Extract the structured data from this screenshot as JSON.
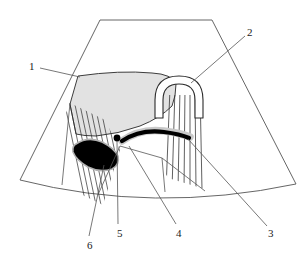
{
  "figure": {
    "type": "ultrasound-sector-scan-line-diagram",
    "title": "",
    "background_color": "#ffffff",
    "outline_color": "#4d4d4d",
    "shade_color": "#e2e2e2",
    "solid_color": "#000000",
    "canvas": {
      "width": 307,
      "height": 276
    }
  },
  "labels": [
    {
      "id": "1",
      "text": "1",
      "x": 29,
      "y": 61,
      "leader_from": [
        40,
        68
      ],
      "leader_to": [
        80,
        77
      ],
      "points_to": "shaded-wedge-region"
    },
    {
      "id": "2",
      "text": "2",
      "x": 247,
      "y": 27,
      "leader_from": [
        245,
        36
      ],
      "leader_to": [
        191,
        83
      ],
      "points_to": "arch-structure"
    },
    {
      "id": "3",
      "text": "3",
      "x": 268,
      "y": 228,
      "leader_from": [
        267,
        226
      ],
      "leader_to": [
        188,
        139
      ],
      "points_to": "solid-band-right-end"
    },
    {
      "id": "4",
      "text": "4",
      "x": 176,
      "y": 228,
      "leader_from": [
        176,
        224
      ],
      "leader_to": [
        129,
        146
      ],
      "points_to": "band-lower-margin"
    },
    {
      "id": "5",
      "text": "5",
      "x": 117,
      "y": 228,
      "leader_from": [
        118,
        224
      ],
      "leader_to": [
        117,
        141
      ],
      "points_to": "focal-dot"
    },
    {
      "id": "6",
      "text": "6",
      "x": 87,
      "y": 240,
      "leader_from": [
        89,
        236
      ],
      "leader_to": [
        104,
        165
      ],
      "points_to": "solid-oval-lesion"
    }
  ],
  "regions": {
    "sector_fan": "trapezoidal curved-linear ultrasound sector outline",
    "shaded_wedge": "light-gray shaded organ region upper-left",
    "solid_oval": "black filled oval lesion lower-left",
    "solid_band": "black curved band across center",
    "focal_dot": "small black dot at left end of band",
    "arch": "white inverted-U outline upper-center",
    "hatch_left": "parallel oblique shadow lines lower-left",
    "hatch_right": "vertical reverberation lines below arch"
  }
}
